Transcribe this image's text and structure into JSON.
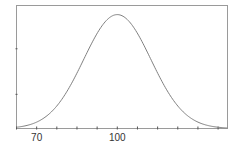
{
  "chart_data": {
    "type": "line",
    "title": "",
    "xlabel": "",
    "ylabel": "",
    "distribution": {
      "mean": 100,
      "sd": 12.5
    },
    "xlim": [
      62.5,
      141
    ],
    "ylim": [
      0,
      1.08
    ],
    "x_tick_step": 7.5,
    "x_tick_labels": [
      {
        "value": 70,
        "label": "70"
      },
      {
        "value": 100,
        "label": "100"
      }
    ],
    "y_ticks": [
      0.3,
      0.7
    ],
    "grid": false,
    "legend": null,
    "series": [
      {
        "name": "density",
        "x": [
          62.5,
          70,
          77.5,
          85,
          92.5,
          100,
          107.5,
          115,
          122.5,
          130,
          137.5,
          141
        ],
        "y": [
          0.011,
          0.056,
          0.198,
          0.487,
          0.835,
          1.0,
          0.835,
          0.487,
          0.198,
          0.056,
          0.011,
          0.005
        ]
      }
    ],
    "colors": {
      "curve": "#808080",
      "axes": "#8c8c8c"
    }
  }
}
